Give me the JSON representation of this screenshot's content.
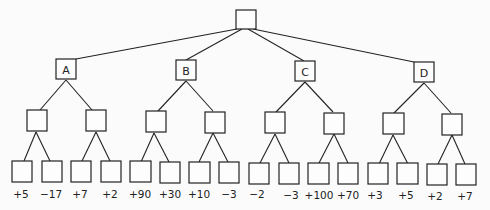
{
  "diagram": {
    "type": "game-tree",
    "root": {
      "label": ""
    },
    "level1": [
      {
        "label": "A"
      },
      {
        "label": "B"
      },
      {
        "label": "C"
      },
      {
        "label": "D"
      }
    ],
    "level2_count": 8,
    "leaves": [
      {
        "value": "+5"
      },
      {
        "value": "−17"
      },
      {
        "value": "+7"
      },
      {
        "value": "+2"
      },
      {
        "value": "+90"
      },
      {
        "value": "+30"
      },
      {
        "value": "+10"
      },
      {
        "value": "−3"
      },
      {
        "value": "−2"
      },
      {
        "value": "−3"
      },
      {
        "value": "+100"
      },
      {
        "value": "+70"
      },
      {
        "value": "+3"
      },
      {
        "value": "+5"
      },
      {
        "value": "+2"
      },
      {
        "value": "+7"
      }
    ]
  }
}
